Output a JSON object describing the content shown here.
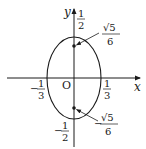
{
  "diagram": {
    "type": "ellipse-on-axes",
    "axes": {
      "x_label": "x",
      "y_label": "y",
      "origin_label": "O"
    },
    "ellipse": {
      "semi_axis_x": "1/3",
      "semi_axis_y": "1/2"
    },
    "ticks": {
      "x_neg": {
        "sign": "−",
        "num": "1",
        "den": "3"
      },
      "x_pos": {
        "sign": "",
        "num": "1",
        "den": "3"
      },
      "y_pos": {
        "sign": "",
        "num": "1",
        "den": "2"
      },
      "y_neg": {
        "sign": "−",
        "num": "1",
        "den": "2"
      }
    },
    "points": [
      {
        "name": "focus-upper",
        "sign": "",
        "num": "√5",
        "den": "6"
      },
      {
        "name": "focus-lower",
        "sign": "−",
        "num": "√5",
        "den": "6"
      }
    ],
    "colors": {
      "stroke": "#1a1a1a",
      "background": "#ffffff"
    }
  }
}
